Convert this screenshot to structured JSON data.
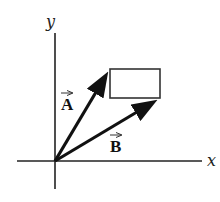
{
  "diagram": {
    "type": "vector-diagram",
    "axes": {
      "x_label": "x",
      "y_label": "y",
      "origin": [
        55,
        161
      ]
    },
    "vectors": [
      {
        "name": "A",
        "label": "A",
        "from": [
          55,
          161
        ],
        "to": [
          110,
          69
        ]
      },
      {
        "name": "B",
        "label": "B",
        "from": [
          55,
          161
        ],
        "to": [
          160,
          98
        ]
      }
    ],
    "rectangle": {
      "x": 110,
      "y": 69,
      "width": 50,
      "height": 29
    },
    "colors": {
      "ink": "#111111",
      "rect": "#333333",
      "background": "#ffffff"
    }
  }
}
